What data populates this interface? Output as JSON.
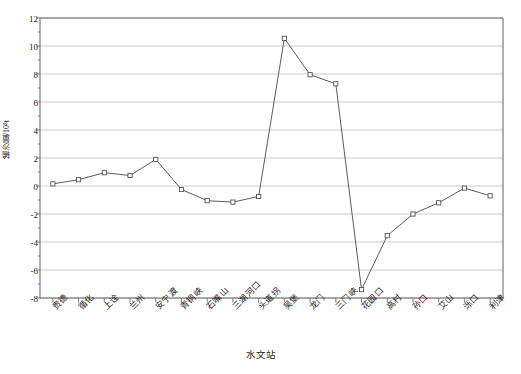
{
  "chart_data": {
    "type": "line",
    "title": "",
    "subtitle": "",
    "xlabel": "水文站",
    "ylabel": "输沙量/10⁸t",
    "ylim": [
      -8,
      12
    ],
    "yticks": [
      -8,
      -6,
      -4,
      -2,
      0,
      2,
      4,
      6,
      8,
      10,
      12
    ],
    "ytick_labels": [
      "-8",
      "-6",
      "-4",
      "-2",
      "0",
      "2",
      "4",
      "6",
      "8",
      "10",
      "12"
    ],
    "grid": "horizontal",
    "legend": "none",
    "marker": "open-square",
    "line_color": "#4a4a4a",
    "grid_color": "#bdbdbd",
    "axis_color": "#6e6e6e",
    "categories": [
      "贵德",
      "循化",
      "上诠",
      "兰州",
      "安宁渡",
      "青铜峡",
      "石嘴山",
      "三湖河口",
      "头道拐",
      "吴堡",
      "龙门",
      "三门峡",
      "花园口",
      "高村",
      "孙口",
      "艾山",
      "泺口",
      "利津"
    ],
    "values": [
      0.15,
      0.45,
      0.95,
      0.75,
      1.9,
      -0.25,
      -1.05,
      -1.15,
      -0.75,
      10.55,
      7.95,
      7.3,
      -7.4,
      -3.55,
      -2.0,
      -1.2,
      -0.15,
      -0.7
    ],
    "annotations": []
  },
  "axis": {
    "x_title": "水文站",
    "y_title": "输沙量/10⁸t"
  },
  "caption": {
    "cropped_text": ""
  }
}
